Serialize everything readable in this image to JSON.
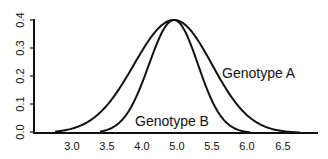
{
  "chart_data": {
    "type": "line",
    "title": "",
    "xlabel": "",
    "ylabel": "",
    "ylim": [
      0.0,
      0.4
    ],
    "grid": false,
    "legend": "inline labels",
    "x_tick_labels": [
      "3.0",
      "3.5",
      "4.0",
      "5.0",
      "5.5",
      "6.0",
      "6.5"
    ],
    "y_tick_labels": [
      "0.0",
      "0.1",
      "0.2",
      "0.3",
      "0.4"
    ],
    "series": [
      {
        "name": "Genotype A",
        "mean": 4.95,
        "sd": 0.55,
        "peak": 0.4,
        "x": [
          3.0,
          3.5,
          4.0,
          4.5,
          4.95,
          5.5,
          6.0,
          6.5
        ],
        "values": [
          0.01,
          0.04,
          0.13,
          0.3,
          0.4,
          0.3,
          0.1,
          0.01
        ]
      },
      {
        "name": "Genotype B",
        "mean": 4.95,
        "sd": 0.38,
        "peak": 0.4,
        "x": [
          3.5,
          4.0,
          4.5,
          4.95,
          5.5,
          6.0
        ],
        "values": [
          0.0,
          0.03,
          0.23,
          0.4,
          0.13,
          0.0
        ]
      }
    ]
  },
  "labels": {
    "series_a": "Genotype A",
    "series_b": "Genotype B"
  },
  "axis": {
    "x_ticks": [
      {
        "label": "3.0",
        "px": 72
      },
      {
        "label": "3.5",
        "px": 107
      },
      {
        "label": "4.0",
        "px": 142
      },
      {
        "label": "5.0",
        "px": 177
      },
      {
        "label": "5.5",
        "px": 212
      },
      {
        "label": "6.0",
        "px": 247
      },
      {
        "label": "6.5",
        "px": 283
      }
    ],
    "y_ticks": [
      {
        "label": "0.0",
        "py": 132
      },
      {
        "label": "0.1",
        "py": 104
      },
      {
        "label": "0.2",
        "py": 76
      },
      {
        "label": "0.3",
        "py": 48
      },
      {
        "label": "0.4",
        "py": 20
      }
    ]
  }
}
